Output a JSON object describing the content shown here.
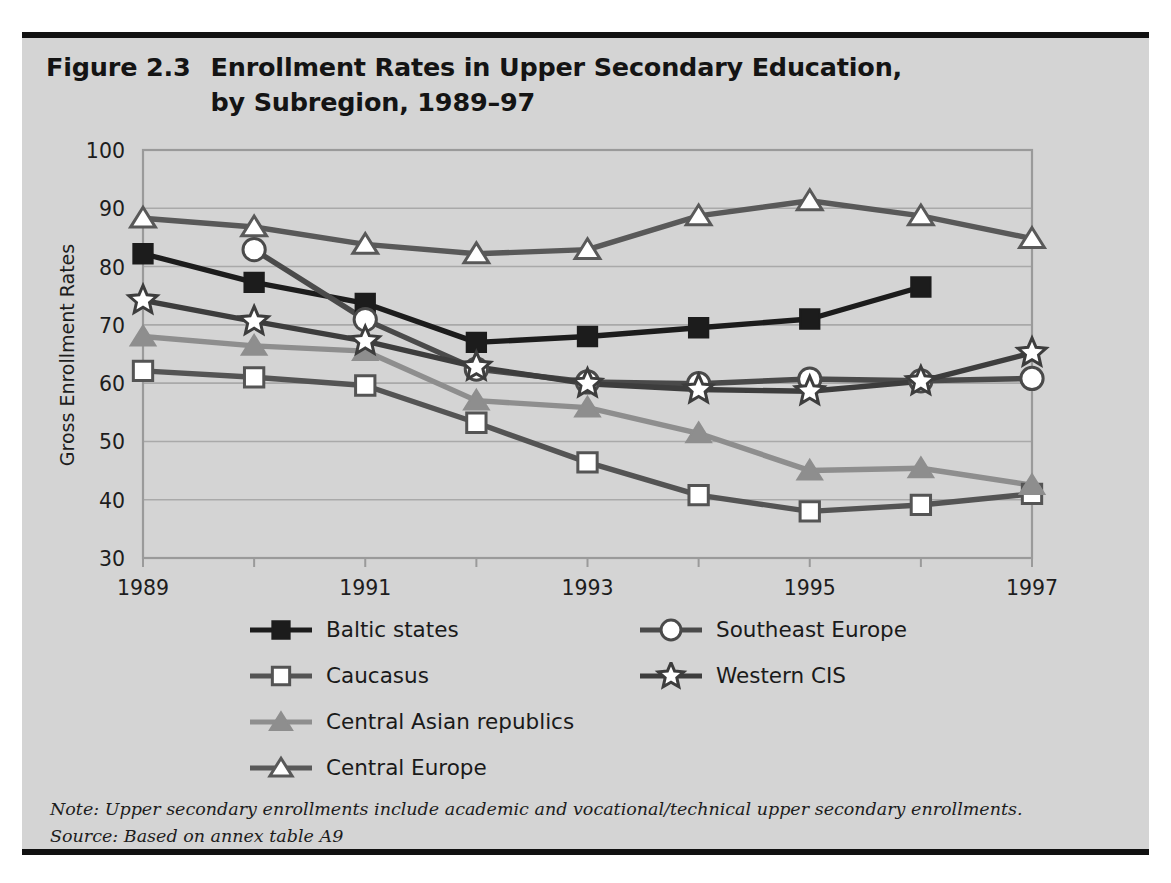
{
  "figure": {
    "number": "Figure 2.3",
    "title": "Enrollment Rates in Upper Secondary Education,\nby Subregion, 1989–97",
    "title_line1": "Enrollment Rates in Upper Secondary Education,",
    "title_line2": "by Subregion, 1989–97"
  },
  "colors": {
    "panel_background": "#d4d4d4",
    "rule": "#111111",
    "gridline": "#a9a9a9",
    "frame": "#9a9a9a",
    "text": "#1a1a1a",
    "baltic_states": "#1c1c1c",
    "caucasus": "#545454",
    "central_asian_republics": "#8e8e8e",
    "central_europe": "#595959",
    "southeast_europe": "#4a4a4a",
    "western_cis": "#3d3d3d"
  },
  "legend": {
    "columns": [
      {
        "items": [
          {
            "label": "Baltic states",
            "marker": "filled-square-marker",
            "color": "#1c1c1c"
          },
          {
            "label": "Caucasus",
            "marker": "open-square-marker",
            "color": "#545454"
          },
          {
            "label": "Central Asian republics",
            "marker": "filled-triangle-marker",
            "color": "#8e8e8e"
          },
          {
            "label": "Central Europe",
            "marker": "open-triangle-marker",
            "color": "#595959"
          }
        ]
      },
      {
        "items": [
          {
            "label": "Southeast Europe",
            "marker": "open-circle-marker",
            "color": "#4a4a4a"
          },
          {
            "label": "Western CIS",
            "marker": "open-star-marker",
            "color": "#3d3d3d"
          }
        ]
      }
    ]
  },
  "footnotes": {
    "note": "Note:  Upper secondary enrollments include academic and vocational/technical upper secondary enrollments.",
    "source": "Source: Based on annex table A9"
  },
  "chart_data": {
    "type": "line",
    "title": "Enrollment Rates in Upper Secondary Education, by Subregion, 1989–97",
    "xlabel": "",
    "ylabel": "Gross Enrollment Rates",
    "x": [
      1989,
      1990,
      1991,
      1992,
      1993,
      1994,
      1995,
      1996,
      1997
    ],
    "xtick_labels": [
      "1989",
      "",
      "1991",
      "",
      "1993",
      "",
      "1995",
      "",
      "1997"
    ],
    "xtick_values": [
      1989,
      1991,
      1993,
      1995,
      1997
    ],
    "ytick_values": [
      30,
      40,
      50,
      60,
      70,
      80,
      90,
      100
    ],
    "ylim": [
      30,
      100
    ],
    "xlim": [
      1989,
      1997
    ],
    "grid": true,
    "legend_position": "bottom",
    "series": [
      {
        "name": "Baltic states",
        "marker": "filled-square-marker",
        "color": "#1c1c1c",
        "values": [
          82.2,
          77.3,
          73.7,
          67.0,
          68.0,
          69.5,
          71.0,
          76.5,
          null
        ]
      },
      {
        "name": "Caucasus",
        "marker": "open-square-marker",
        "color": "#545454",
        "values": [
          62.1,
          61.0,
          59.6,
          53.2,
          46.4,
          40.8,
          38.0,
          39.1,
          41.0
        ]
      },
      {
        "name": "Central Asian republics",
        "marker": "filled-triangle-marker",
        "color": "#8e8e8e",
        "values": [
          68.0,
          66.4,
          65.5,
          57.0,
          55.8,
          51.4,
          45.0,
          45.4,
          42.5
        ]
      },
      {
        "name": "Central Europe",
        "marker": "open-triangle-marker",
        "color": "#595959",
        "values": [
          88.3,
          86.8,
          83.8,
          82.2,
          82.9,
          88.7,
          91.3,
          88.7,
          84.8
        ]
      },
      {
        "name": "Southeast Europe",
        "marker": "open-circle-marker",
        "color": "#4a4a4a",
        "values": [
          null,
          82.9,
          70.9,
          62.4,
          60.2,
          59.9,
          60.7,
          60.4,
          60.8
        ]
      },
      {
        "name": "Western CIS",
        "marker": "open-star-marker",
        "color": "#3d3d3d",
        "values": [
          74.2,
          70.6,
          67.2,
          62.8,
          59.9,
          58.9,
          58.6,
          60.3,
          65.2
        ]
      }
    ]
  }
}
